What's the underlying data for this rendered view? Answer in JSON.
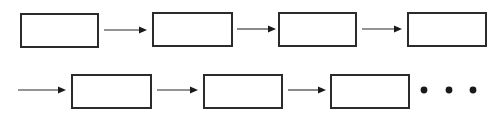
{
  "diagram": {
    "canvas": {
      "width": 501,
      "height": 119,
      "background_color": "#ffffff"
    },
    "style": {
      "box_fill": "#ffffff",
      "box_stroke": "#2b2b2b",
      "box_stroke_width": 2,
      "arrow_color": "#2b2b2b",
      "arrow_head_color": "#1a1a1a",
      "arrow_line_width": 1.1,
      "dot_color": "#1a1a1a"
    },
    "rows": [
      {
        "id": "row-1",
        "label": "",
        "boxes": [
          {
            "id": "box-1-1",
            "label": "",
            "x": 20,
            "y": 13,
            "width": 79,
            "height": 35
          },
          {
            "id": "box-1-2",
            "label": "",
            "x": 152,
            "y": 12,
            "width": 81,
            "height": 35
          },
          {
            "id": "box-1-3",
            "label": "",
            "x": 278,
            "y": 12,
            "width": 79,
            "height": 35
          },
          {
            "id": "box-1-4",
            "label": "",
            "x": 407,
            "y": 12,
            "width": 80,
            "height": 35
          }
        ],
        "arrows": [
          {
            "id": "arrow-1-1",
            "label": "",
            "x1": 104,
            "x2": 147,
            "y": 30
          },
          {
            "id": "arrow-1-2",
            "label": "",
            "x1": 237,
            "x2": 276,
            "y": 29
          },
          {
            "id": "arrow-1-3",
            "label": "",
            "x1": 362,
            "x2": 402,
            "y": 29
          }
        ],
        "dots": []
      },
      {
        "id": "row-2",
        "label": "",
        "boxes": [
          {
            "id": "box-2-1",
            "label": "",
            "x": 71,
            "y": 74,
            "width": 81,
            "height": 35
          },
          {
            "id": "box-2-2",
            "label": "",
            "x": 203,
            "y": 74,
            "width": 80,
            "height": 35
          },
          {
            "id": "box-2-3",
            "label": "",
            "x": 330,
            "y": 74,
            "width": 80,
            "height": 35
          }
        ],
        "arrows": [
          {
            "id": "arrow-2-0",
            "label": "",
            "x1": 18,
            "x2": 66,
            "y": 90
          },
          {
            "id": "arrow-2-1",
            "label": "",
            "x1": 157,
            "x2": 198,
            "y": 90
          },
          {
            "id": "arrow-2-2",
            "label": "",
            "x1": 288,
            "x2": 326,
            "y": 90
          }
        ],
        "dots": [
          {
            "id": "dot-1",
            "cx": 424,
            "cy": 90,
            "r": 3.4
          },
          {
            "id": "dot-2",
            "cx": 449,
            "cy": 90,
            "r": 3.4
          },
          {
            "id": "dot-3",
            "cx": 473,
            "cy": 90,
            "r": 3.4
          }
        ]
      }
    ]
  }
}
